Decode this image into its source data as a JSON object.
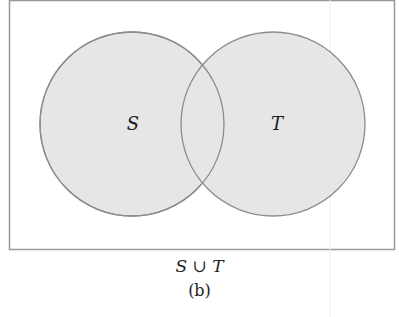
{
  "diagram": {
    "type": "venn",
    "universe": {
      "x": 9,
      "y": 0,
      "width": 385,
      "height": 249
    },
    "sets": [
      {
        "name": "S",
        "label": "S",
        "cx": 132,
        "cy": 124,
        "r": 92
      },
      {
        "name": "T",
        "label": "T",
        "cx": 273,
        "cy": 124,
        "r": 92
      }
    ],
    "shaded_region": "S ∪ T",
    "colors": {
      "fill": "#e6e6e6",
      "stroke": "#8c8c8c",
      "border": "#999999"
    }
  },
  "caption": {
    "expression": "S ∪ T",
    "label": "(b)"
  }
}
